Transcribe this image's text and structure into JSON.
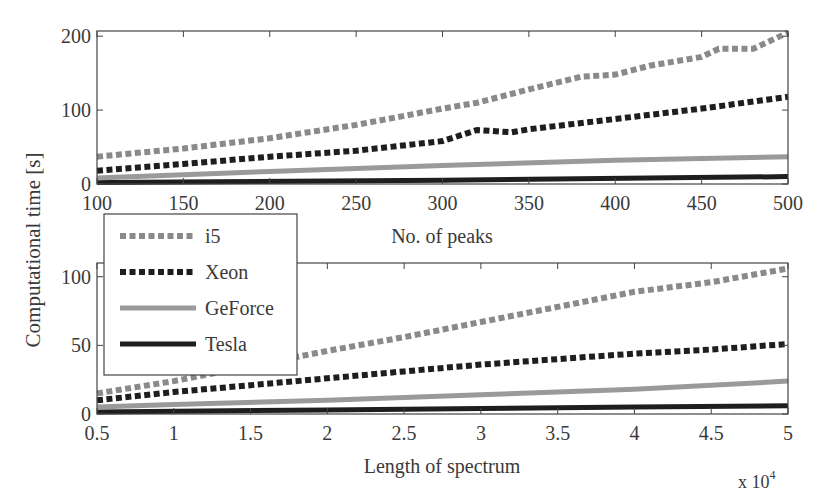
{
  "figure": {
    "ylabel": "Computational time [s]",
    "legend": [
      "i5",
      "Xeon",
      "GeForce",
      "Tesla"
    ]
  },
  "chart_data": [
    {
      "type": "line",
      "title": "",
      "xlabel": "No. of peaks",
      "ylabel": "Computational time [s]",
      "xlim": [
        100,
        500
      ],
      "ylim": [
        0,
        207
      ],
      "xticks": [
        100,
        150,
        200,
        250,
        300,
        350,
        400,
        450,
        500
      ],
      "yticks": [
        0,
        100,
        200
      ],
      "grid": false,
      "legend_position": "below-left, overlapping lower panel",
      "series": [
        {
          "name": "i5",
          "style": "dotted",
          "color": "#8a8a8a",
          "x": [
            100,
            150,
            200,
            250,
            300,
            320,
            350,
            380,
            400,
            420,
            450,
            460,
            480,
            500
          ],
          "values": [
            37,
            48,
            62,
            80,
            102,
            110,
            128,
            145,
            148,
            160,
            172,
            183,
            183,
            205
          ]
        },
        {
          "name": "Xeon",
          "style": "dotted",
          "color": "#1e1e1e",
          "x": [
            100,
            150,
            200,
            250,
            300,
            320,
            340,
            350,
            400,
            450,
            500
          ],
          "values": [
            18,
            27,
            37,
            45,
            58,
            73,
            70,
            74,
            88,
            102,
            118
          ]
        },
        {
          "name": "GeForce",
          "style": "solid",
          "color": "#9a9a9a",
          "x": [
            100,
            200,
            300,
            400,
            500
          ],
          "values": [
            8,
            17,
            25,
            32,
            37
          ]
        },
        {
          "name": "Tesla",
          "style": "solid",
          "color": "#1e1e1e",
          "x": [
            100,
            300,
            500
          ],
          "values": [
            2,
            5,
            10
          ]
        }
      ]
    },
    {
      "type": "line",
      "title": "",
      "xlabel": "Length of spectrum",
      "x_multiplier": "x 10^4",
      "ylabel": "Computational time [s]",
      "xlim": [
        0.5,
        5
      ],
      "ylim": [
        0,
        110
      ],
      "xticks": [
        0.5,
        1,
        1.5,
        2,
        2.5,
        3,
        3.5,
        4,
        4.5,
        5
      ],
      "yticks": [
        0,
        50,
        100
      ],
      "grid": false,
      "series": [
        {
          "name": "i5",
          "style": "dotted",
          "color": "#8a8a8a",
          "x": [
            0.5,
            1,
            1.5,
            2,
            2.5,
            3,
            3.5,
            4,
            4.5,
            5
          ],
          "values": [
            15,
            24,
            35,
            46,
            56,
            67,
            78,
            89,
            96,
            106
          ]
        },
        {
          "name": "Xeon",
          "style": "dotted",
          "color": "#1e1e1e",
          "x": [
            0.5,
            1,
            1.5,
            2,
            2.5,
            3,
            3.5,
            4,
            4.5,
            5
          ],
          "values": [
            10,
            16,
            21,
            26,
            31,
            36,
            40,
            44,
            47,
            51
          ]
        },
        {
          "name": "GeForce",
          "style": "solid",
          "color": "#9a9a9a",
          "x": [
            0.5,
            1,
            2,
            3,
            4,
            5
          ],
          "values": [
            5,
            7,
            10,
            14,
            18,
            24
          ]
        },
        {
          "name": "Tesla",
          "style": "solid",
          "color": "#1e1e1e",
          "x": [
            0.5,
            2,
            3,
            4,
            5
          ],
          "values": [
            1.5,
            3,
            4,
            5,
            6
          ]
        }
      ]
    }
  ]
}
